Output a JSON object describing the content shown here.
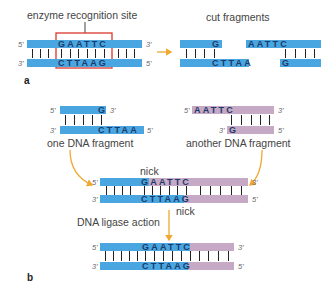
{
  "panel_a": {
    "letter": "a",
    "title_left": "enzyme recognition site",
    "title_right": "cut fragments",
    "intact": {
      "top": "GAATTC",
      "bottom": "CTTAAG",
      "top_5": "5'",
      "top_3": "3'",
      "bot_3": "3'",
      "bot_5": "5'"
    },
    "cut_left": {
      "top": "G",
      "bottom": "CTTAA"
    },
    "cut_right": {
      "top": "AATTC",
      "bottom": "G"
    }
  },
  "panel_b": {
    "letter": "b",
    "frag1": {
      "label": "one DNA fragment",
      "top": "G",
      "bottom": "CTTAA",
      "top_5": "5'",
      "top_3": "3'",
      "bot_3": "3'",
      "bot_5": "5'"
    },
    "frag2": {
      "label": "another DNA fragment",
      "top": "AATTC",
      "bottom": "G",
      "top_5": "5'",
      "top_3": "3'",
      "bot_3": "3'",
      "bot_5": "5'"
    },
    "annealed": {
      "nick_top": "nick",
      "nick_bottom": "nick",
      "top": "GAATTC",
      "bottom": "CTTAAG",
      "top_5": "5'",
      "top_3": "3'",
      "bot_3": "3'",
      "bot_5": "5'"
    },
    "step_label": "DNA ligase action",
    "ligated": {
      "top": "GAATTC",
      "bottom": "CTTAAG",
      "top_5": "5'",
      "top_3": "3'",
      "bot_3": "3'",
      "bot_5": "5'"
    }
  },
  "colors": {
    "blue_strand": "#4aa6e0",
    "purple_strand": "#c6a9c4",
    "box": "#d9372b",
    "arrow": "#f0a830"
  }
}
